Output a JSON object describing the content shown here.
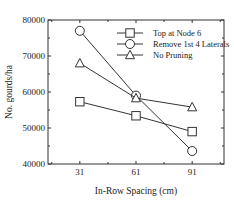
{
  "chart_data": {
    "type": "line",
    "title": "",
    "xlabel": "In-Row Spacing (cm)",
    "ylabel": "No. gourds/ha",
    "categories": [
      "31",
      "61",
      "91"
    ],
    "x": [
      31,
      61,
      91
    ],
    "xlim": [
      14,
      108
    ],
    "ylim": [
      40000,
      80000
    ],
    "yticks": [
      40000,
      50000,
      60000,
      70000,
      80000
    ],
    "ytick_labels": [
      "40000",
      "50000",
      "60000",
      "70000",
      "80000"
    ],
    "grid": false,
    "legend_position": "upper right (inside)",
    "series": [
      {
        "name": "Top at Node 6",
        "marker": "square",
        "values": [
          57300,
          53400,
          49000
        ]
      },
      {
        "name": "Remove 1st 4 Laterals",
        "marker": "circle",
        "values": [
          77000,
          59000,
          43600
        ]
      },
      {
        "name": "No Pruning",
        "marker": "triangle",
        "values": [
          68000,
          58300,
          55800
        ]
      }
    ]
  },
  "colors": {
    "line": "#333333",
    "axis": "#333333",
    "marker_fill": "#ffffff"
  }
}
